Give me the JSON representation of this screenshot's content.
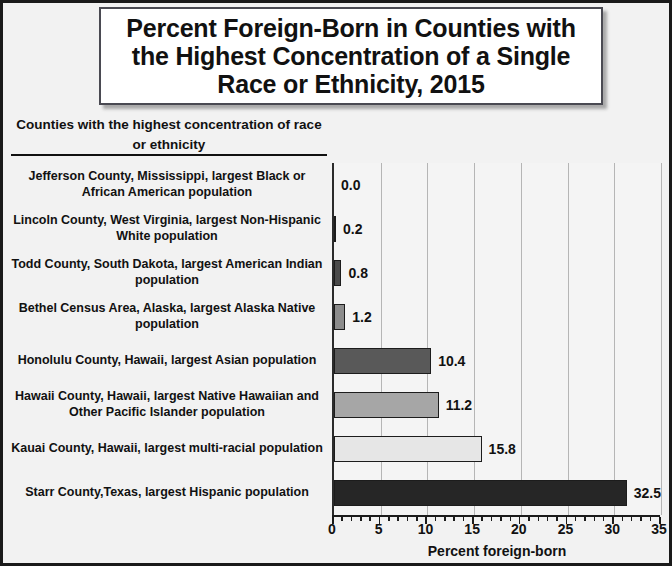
{
  "title": "Percent Foreign-Born in Counties with the Highest Concentration of a Single Race or Ethnicity, 2015",
  "category_axis_heading": "Counties with the highest concentration of race or ethnicity",
  "chart_data": {
    "type": "bar",
    "orientation": "horizontal",
    "title": "Percent Foreign-Born in Counties with the Highest Concentration of a Single Race or Ethnicity, 2015",
    "xlabel": "Percent foreign-born",
    "ylabel": "Counties with the highest concentration of race or ethnicity",
    "xlim": [
      0,
      35
    ],
    "xticks": [
      0,
      5,
      10,
      15,
      20,
      25,
      30,
      35
    ],
    "xtick_labels": [
      "0",
      "5",
      "10",
      "15",
      "20",
      "25",
      "30",
      "35"
    ],
    "minor_tick_interval": 1,
    "grid": "vertical",
    "legend": "none",
    "categories": [
      "Jefferson County, Mississippi, largest Black or African American population",
      "Lincoln County, West Virginia, largest Non-Hispanic White population",
      "Todd County, South Dakota, largest American Indian population",
      "Bethel Census Area, Alaska, largest Alaska Native population",
      "Honolulu County, Hawaii, largest Asian population",
      "Hawaii County, Hawaii, largest Native Hawaiian and Other Pacific Islander population",
      "Kauai County, Hawaii, largest multi-racial population",
      "Starr County,Texas, largest Hispanic population"
    ],
    "values": [
      0.0,
      0.2,
      0.8,
      1.2,
      10.4,
      11.2,
      15.8,
      32.5
    ],
    "value_labels": [
      "0.0",
      "0.2",
      "0.8",
      "1.2",
      "10.4",
      "11.2",
      "15.8",
      "32.5"
    ],
    "bar_colors": [
      "#f4f4f4",
      "#1f1f1f",
      "#4a4a4a",
      "#8c8c8c",
      "#595959",
      "#a6a6a6",
      "#e6e6e6",
      "#262626"
    ]
  },
  "colors": {
    "frame_border": "#1a1a1a",
    "background": "#f2f2f2",
    "plot_background": "#f4f4f4",
    "gridline": "#b5b5b5",
    "text": "#111111"
  }
}
